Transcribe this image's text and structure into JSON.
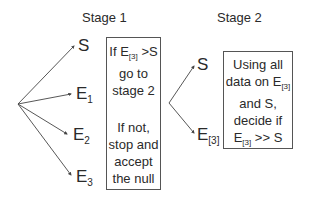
{
  "stage1": {
    "title": "Stage 1",
    "nodes": [
      {
        "base": "S",
        "sub": ""
      },
      {
        "base": "E",
        "sub": "1"
      },
      {
        "base": "E",
        "sub": "2"
      },
      {
        "base": "E",
        "sub": "3"
      }
    ],
    "box": {
      "line1_pre": "If E",
      "line1_sub": "[3]",
      "line1_post": " >S",
      "line2": "go to",
      "line3": "stage 2",
      "line4": "If not,",
      "line5": "stop and",
      "line6": "accept",
      "line7": "the null"
    }
  },
  "stage2": {
    "title": "Stage 2",
    "nodes": [
      {
        "base": "S",
        "sub": ""
      },
      {
        "base": "E",
        "sub": "[3]"
      }
    ],
    "box": {
      "line1": "Using all",
      "line2_pre": "data on E",
      "line2_sub": "[3]",
      "line3": "and S,",
      "line4": "decide if",
      "line5_pre": "E",
      "line5_sub": "[3]",
      "line5_post": " >> S"
    }
  },
  "colors": {
    "line": "#444444",
    "text": "#2a2a2a",
    "border": "#555555"
  }
}
